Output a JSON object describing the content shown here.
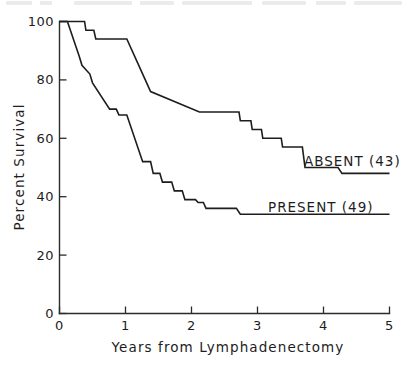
{
  "chart_data": {
    "type": "line",
    "subtype": "kaplan-meier-step",
    "title": "",
    "xlabel": "Years from Lymphadenectomy",
    "ylabel": "Percent Survival",
    "xlim": [
      0,
      5
    ],
    "ylim": [
      0,
      100
    ],
    "xticks": [
      0,
      1,
      2,
      3,
      4,
      5
    ],
    "xtick_labels": [
      "0",
      "1",
      "2",
      "3",
      "4",
      "5"
    ],
    "yticks": [
      0,
      20,
      40,
      60,
      80,
      100
    ],
    "ytick_labels": [
      "0",
      "20",
      "40",
      "60",
      "80",
      "100"
    ],
    "grid": false,
    "legend_position": "inline-right",
    "series": [
      {
        "name": "ABSENT (43)",
        "label": "ABSENT (43)",
        "n": 43,
        "color": "#1d1d1d",
        "final_value": 48,
        "points": [
          [
            0.0,
            100
          ],
          [
            0.38,
            100
          ],
          [
            0.4,
            97
          ],
          [
            0.52,
            97
          ],
          [
            0.55,
            94
          ],
          [
            1.02,
            94
          ],
          [
            1.3,
            80
          ],
          [
            1.38,
            76
          ],
          [
            2.12,
            69
          ],
          [
            2.72,
            69
          ],
          [
            2.74,
            66
          ],
          [
            2.9,
            66
          ],
          [
            2.92,
            63
          ],
          [
            3.06,
            63
          ],
          [
            3.08,
            60
          ],
          [
            3.36,
            60
          ],
          [
            3.38,
            57
          ],
          [
            3.68,
            57
          ],
          [
            3.72,
            50
          ],
          [
            4.22,
            50
          ],
          [
            4.28,
            48
          ],
          [
            5.0,
            48
          ]
        ]
      },
      {
        "name": "PRESENT (49)",
        "label": "PRESENT (49)",
        "n": 49,
        "color": "#1d1d1d",
        "final_value": 34,
        "points": [
          [
            0.0,
            100
          ],
          [
            0.12,
            100
          ],
          [
            0.3,
            88
          ],
          [
            0.34,
            85
          ],
          [
            0.46,
            82
          ],
          [
            0.5,
            79
          ],
          [
            0.76,
            70
          ],
          [
            0.86,
            70
          ],
          [
            0.9,
            68
          ],
          [
            1.02,
            68
          ],
          [
            1.26,
            52
          ],
          [
            1.38,
            52
          ],
          [
            1.42,
            48
          ],
          [
            1.52,
            48
          ],
          [
            1.56,
            45
          ],
          [
            1.7,
            45
          ],
          [
            1.74,
            42
          ],
          [
            1.86,
            42
          ],
          [
            1.9,
            39
          ],
          [
            2.06,
            39
          ],
          [
            2.1,
            38
          ],
          [
            2.18,
            38
          ],
          [
            2.22,
            36
          ],
          [
            2.68,
            36
          ],
          [
            2.74,
            34
          ],
          [
            5.0,
            34
          ]
        ]
      }
    ]
  },
  "labels": {
    "y_axis_title": "Percent Survival",
    "x_axis_title": "Years from Lymphadenectomy",
    "series_absent": "ABSENT (43)",
    "series_present": "PRESENT (49)",
    "ytick_100": "100",
    "ytick_80": "80",
    "ytick_60": "60",
    "ytick_40": "40",
    "ytick_20": "20",
    "ytick_0": "0",
    "xtick_0": "0",
    "xtick_1": "1",
    "xtick_2": "2",
    "xtick_3": "3",
    "xtick_4": "4",
    "xtick_5": "5"
  },
  "colors": {
    "ink": "#1d1d1d",
    "axis": "#2b2b2b",
    "background": "#ffffff"
  }
}
